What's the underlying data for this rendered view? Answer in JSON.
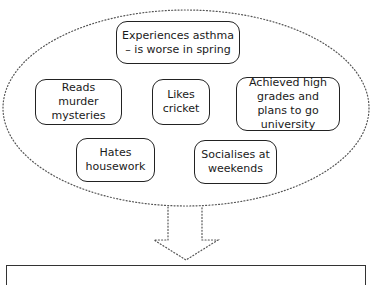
{
  "diagram": {
    "type": "trait-cluster-to-summary",
    "cluster_shape": "dotted-ellipse",
    "nodes": [
      {
        "id": "asthma",
        "label": "Experiences asthma – is worse in spring"
      },
      {
        "id": "reads",
        "label": "Reads murder mysteries"
      },
      {
        "id": "cricket",
        "label": "Likes cricket"
      },
      {
        "id": "grades",
        "label": "Achieved high grades and plans to go university"
      },
      {
        "id": "housework",
        "label": "Hates housework"
      },
      {
        "id": "socialises",
        "label": "Socialises at weekends"
      }
    ],
    "connector": "dotted-down-arrow",
    "output_panel": {
      "label": ""
    }
  },
  "colors": {
    "stroke": "#222222",
    "dots": "#555555",
    "background": "#ffffff"
  }
}
